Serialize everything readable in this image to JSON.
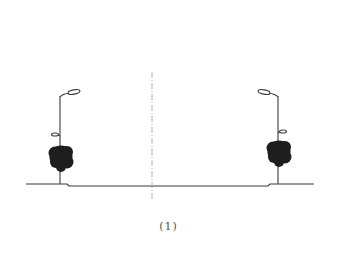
{
  "diagram": {
    "type": "street-cross-section",
    "caption": "(1)",
    "colors": {
      "line": "#3a3a3a",
      "canopy": "#1e1e1e",
      "centerline": "#9a9a9a",
      "caption": "#555555"
    },
    "ground": {
      "left_sidewalk": {
        "x1": 26,
        "x2": 67,
        "y": 184
      },
      "roadway": {
        "x1": 69,
        "x2": 268,
        "y": 186
      },
      "right_sidewalk": {
        "x1": 270,
        "x2": 314,
        "y": 184
      }
    },
    "centerline": {
      "x": 152,
      "y1": 72,
      "y2": 200
    },
    "elements": [
      {
        "name": "left-streetlamp",
        "pole_x": 60,
        "pole_top": 96,
        "pole_bottom": 184,
        "upper_arm_direction": "right",
        "lower_arm_direction": "left",
        "lower_arm_y": 136
      },
      {
        "name": "left-tree",
        "cx": 61,
        "cy": 157,
        "r": 12
      },
      {
        "name": "right-streetlamp",
        "pole_x": 278,
        "pole_top": 96,
        "pole_bottom": 184,
        "upper_arm_direction": "left",
        "lower_arm_direction": "right",
        "lower_arm_y": 133
      },
      {
        "name": "right-tree",
        "cx": 279,
        "cy": 152,
        "r": 12
      }
    ]
  }
}
